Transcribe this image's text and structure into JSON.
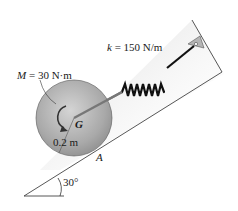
{
  "diagram": {
    "moment": {
      "symbol": "M",
      "value": "= 30 N·m"
    },
    "spring": {
      "symbol": "k",
      "value": "= 150 N/m"
    },
    "center_label": "G",
    "radius_label": "0.2 m",
    "contact_label": "A",
    "angle_label": "30°"
  },
  "colors": {
    "disk": "#a8a8a8",
    "incline_shadow": "#cfcfcf",
    "line": "#222222"
  }
}
